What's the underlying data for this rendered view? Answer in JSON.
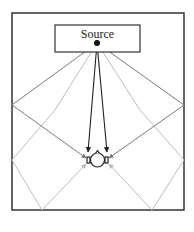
{
  "diagram": {
    "title": "",
    "source_label": "Source",
    "nodes": [
      {
        "id": "source",
        "label": "Source",
        "type": "box-with-point"
      },
      {
        "id": "listener",
        "label": "",
        "type": "head-with-ears"
      }
    ],
    "paths": [
      {
        "id": "direct-left",
        "kind": "direct",
        "color": "#333333"
      },
      {
        "id": "direct-right",
        "kind": "direct",
        "color": "#333333"
      },
      {
        "id": "reflect-left-wall",
        "kind": "first-order-reflection",
        "color": "#7a7a7a"
      },
      {
        "id": "reflect-right-wall",
        "kind": "first-order-reflection",
        "color": "#7a7a7a"
      },
      {
        "id": "reflect-left-floor",
        "kind": "second-order-reflection",
        "color": "#b5b5b5"
      },
      {
        "id": "reflect-right-floor",
        "kind": "second-order-reflection",
        "color": "#b5b5b5"
      }
    ],
    "colors": {
      "room_wall": "#333333",
      "direct": "#222222",
      "first_order": "#7a7a7a",
      "second_order": "#bdbdbd"
    }
  }
}
